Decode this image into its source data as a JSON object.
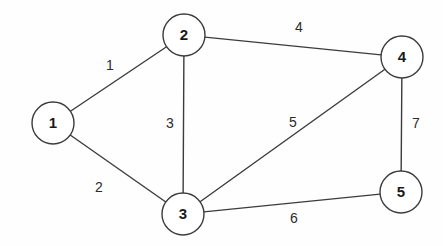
{
  "figure": {
    "name": "weighted-undirected-graph",
    "background_color": "#fefefe",
    "stroke_color": "#3c3c3c",
    "label_color": "#1a1a1a",
    "width": 443,
    "height": 246
  },
  "chart_data": {
    "type": "diagram",
    "diagram_type": "weighted-undirected-graph",
    "title": "",
    "node_radius": 21,
    "nodes": [
      {
        "id": "1",
        "label": "1",
        "x": 53,
        "y": 123
      },
      {
        "id": "2",
        "label": "2",
        "x": 184,
        "y": 35
      },
      {
        "id": "3",
        "label": "3",
        "x": 183,
        "y": 214
      },
      {
        "id": "4",
        "label": "4",
        "x": 402,
        "y": 57
      },
      {
        "id": "5",
        "label": "5",
        "x": 401,
        "y": 192
      }
    ],
    "edges": [
      {
        "from": "1",
        "to": "2",
        "weight": "1",
        "label_x": 110,
        "label_y": 66
      },
      {
        "from": "1",
        "to": "3",
        "weight": "2",
        "label_x": 99,
        "label_y": 188
      },
      {
        "from": "2",
        "to": "3",
        "weight": "3",
        "label_x": 170,
        "label_y": 124
      },
      {
        "from": "2",
        "to": "4",
        "weight": "4",
        "label_x": 299,
        "label_y": 28
      },
      {
        "from": "3",
        "to": "4",
        "weight": "5",
        "label_x": 293,
        "label_y": 123
      },
      {
        "from": "3",
        "to": "5",
        "weight": "6",
        "label_x": 294,
        "label_y": 219
      },
      {
        "from": "4",
        "to": "5",
        "weight": "7",
        "label_x": 416,
        "label_y": 124
      }
    ]
  }
}
